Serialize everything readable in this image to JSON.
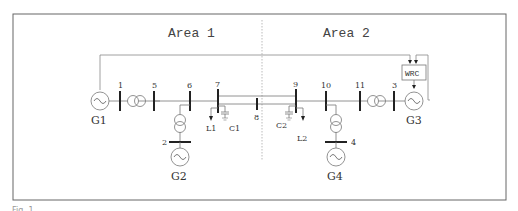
{
  "diagram": {
    "title_areas": [
      {
        "label": "Area 1"
      },
      {
        "label": "Area 2"
      }
    ],
    "buses": [
      {
        "id": "1",
        "label": "1"
      },
      {
        "id": "5",
        "label": "5"
      },
      {
        "id": "6",
        "label": "6"
      },
      {
        "id": "7",
        "label": "7"
      },
      {
        "id": "8",
        "label": "8"
      },
      {
        "id": "9",
        "label": "9"
      },
      {
        "id": "10",
        "label": "10"
      },
      {
        "id": "11",
        "label": "11"
      },
      {
        "id": "3",
        "label": "3"
      },
      {
        "id": "2",
        "label": "2"
      },
      {
        "id": "4",
        "label": "4"
      }
    ],
    "generators": [
      {
        "label": "G1"
      },
      {
        "label": "G2"
      },
      {
        "label": "G3"
      },
      {
        "label": "G4"
      }
    ],
    "loads": [
      {
        "label": "L1"
      },
      {
        "label": "L2"
      }
    ],
    "capacitors": [
      {
        "label": "C1"
      },
      {
        "label": "C2"
      }
    ],
    "controller": {
      "label": "WRC"
    },
    "caption": "Fig. 1"
  },
  "colors": {
    "line": "#777777",
    "bus": "#222222",
    "frame": "#666666",
    "divider": "#aaaaaa"
  }
}
